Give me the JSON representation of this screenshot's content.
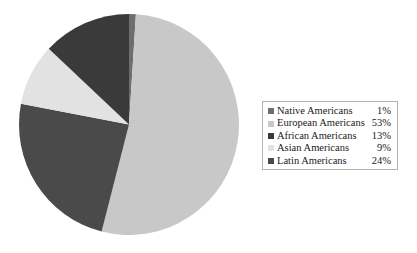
{
  "chart_data": {
    "type": "pie",
    "title": "",
    "subtitle": "",
    "xlabel": "",
    "ylabel": "",
    "legend_position": "right",
    "grid": false,
    "start_angle_deg": 0,
    "direction": "clockwise",
    "categories": [
      "Native Americans",
      "European Americans",
      "African Americans",
      "Asian Americans",
      "Latin Americans"
    ],
    "values": [
      1,
      53,
      13,
      9,
      24
    ],
    "value_labels": [
      "1%",
      "53%",
      "13%",
      "9%",
      "24%"
    ],
    "unit": "%",
    "colors": [
      "#6e6e6e",
      "#c8c8c8",
      "#3a3a3a",
      "#e2e2e2",
      "#4a4a4a"
    ],
    "slices": [
      {
        "label": "Native Americans",
        "value": 1,
        "display": "1%",
        "color": "#6e6e6e",
        "start_deg": 0,
        "end_deg": 3.6
      },
      {
        "label": "European Americans",
        "value": 53,
        "display": "53%",
        "color": "#c8c8c8",
        "start_deg": 3.6,
        "end_deg": 194.4
      },
      {
        "label": "Latin Americans",
        "value": 24,
        "display": "24%",
        "color": "#4a4a4a",
        "start_deg": 194.4,
        "end_deg": 280.8
      },
      {
        "label": "Asian Americans",
        "value": 9,
        "display": "9%",
        "color": "#e2e2e2",
        "start_deg": 280.8,
        "end_deg": 313.2
      },
      {
        "label": "African Americans",
        "value": 13,
        "display": "13%",
        "color": "#3a3a3a",
        "start_deg": 313.2,
        "end_deg": 360
      }
    ]
  },
  "legend": {
    "border_color": "#b4b4b4",
    "entries": [
      {
        "swatch": "#6e6e6e",
        "label": "Native Americans",
        "value": "1%"
      },
      {
        "swatch": "#c8c8c8",
        "label": "European Americans",
        "value": "53%"
      },
      {
        "swatch": "#3a3a3a",
        "label": "African Americans",
        "value": "13%"
      },
      {
        "swatch": "#e2e2e2",
        "label": "Asian Americans",
        "value": "9%"
      },
      {
        "swatch": "#4a4a4a",
        "label": "Latin Americans",
        "value": "24%"
      }
    ]
  }
}
